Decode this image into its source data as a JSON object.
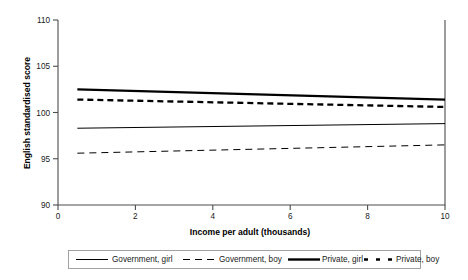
{
  "chart_data": {
    "type": "line",
    "title": "",
    "xlabel": "Income per adult (thousands)",
    "ylabel": "English standardised score",
    "xlim": [
      0,
      10
    ],
    "ylim": [
      90,
      110
    ],
    "xticks": [
      "0",
      "2",
      "4",
      "6",
      "8",
      "10"
    ],
    "yticks": [
      "90",
      "95",
      "100",
      "105",
      "110"
    ],
    "grid": false,
    "legend_position": "bottom",
    "x": [
      0.5,
      10
    ],
    "series": [
      {
        "name": "Government, girl",
        "style": "thin-solid",
        "values": [
          98.3,
          98.8
        ]
      },
      {
        "name": "Government, boy",
        "style": "thin-dashed",
        "values": [
          95.6,
          96.5
        ]
      },
      {
        "name": "Private, girl",
        "style": "thick-solid",
        "values": [
          102.5,
          101.4
        ]
      },
      {
        "name": "Private, boy",
        "style": "thick-dashed",
        "values": [
          101.4,
          100.6
        ]
      }
    ]
  },
  "axes": {
    "y_title": "English standardised score",
    "x_title": "Income per adult (thousands)",
    "y_tick_labels": [
      "110",
      "105",
      "100",
      "95",
      "90"
    ],
    "x_tick_labels": [
      "0",
      "2",
      "4",
      "6",
      "8",
      "10"
    ]
  },
  "legend": {
    "items": [
      {
        "label": "Government, girl",
        "style": "thin-solid"
      },
      {
        "label": "Government, boy",
        "style": "thin-dashed"
      },
      {
        "label": "Private, girl",
        "style": "thick-solid"
      },
      {
        "label": "Private, boy",
        "style": "thick-dashed"
      }
    ]
  }
}
